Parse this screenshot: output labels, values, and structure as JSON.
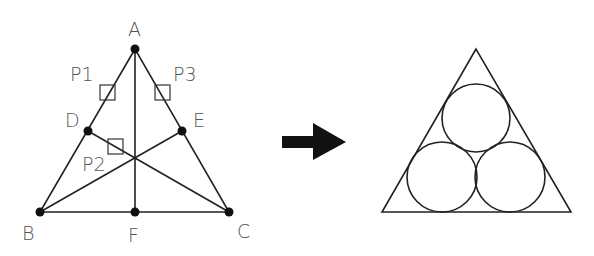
{
  "left_figure": {
    "points": [
      {
        "label": "A",
        "x": 135,
        "y": 49,
        "lx": 128,
        "ly": 36
      },
      {
        "label": "B",
        "x": 40,
        "y": 212,
        "lx": 22,
        "ly": 240
      },
      {
        "label": "C",
        "x": 229,
        "y": 212,
        "lx": 237,
        "ly": 238
      },
      {
        "label": "D",
        "x": 88,
        "y": 131,
        "lx": 65,
        "ly": 127
      },
      {
        "label": "E",
        "x": 182,
        "y": 131,
        "lx": 193,
        "ly": 127
      },
      {
        "label": "F",
        "x": 135,
        "y": 212,
        "lx": 128,
        "ly": 242
      }
    ],
    "pick_boxes": [
      {
        "label": "P1",
        "x": 100,
        "y": 85,
        "lx": 70,
        "ly": 81
      },
      {
        "label": "P2",
        "x": 108,
        "y": 139,
        "lx": 82,
        "ly": 171
      },
      {
        "label": "P3",
        "x": 155,
        "y": 85,
        "lx": 173,
        "ly": 81
      }
    ]
  },
  "arrow": {
    "direction": "right"
  },
  "right_figure": {
    "triangle": {
      "apex": [
        476,
        49
      ],
      "left": [
        382,
        212
      ],
      "right": [
        571,
        212
      ]
    },
    "circles": [
      {
        "cx": 476,
        "cy": 118,
        "r": 34
      },
      {
        "cx": 442,
        "cy": 177,
        "r": 35
      },
      {
        "cx": 510,
        "cy": 177,
        "r": 35
      }
    ]
  }
}
